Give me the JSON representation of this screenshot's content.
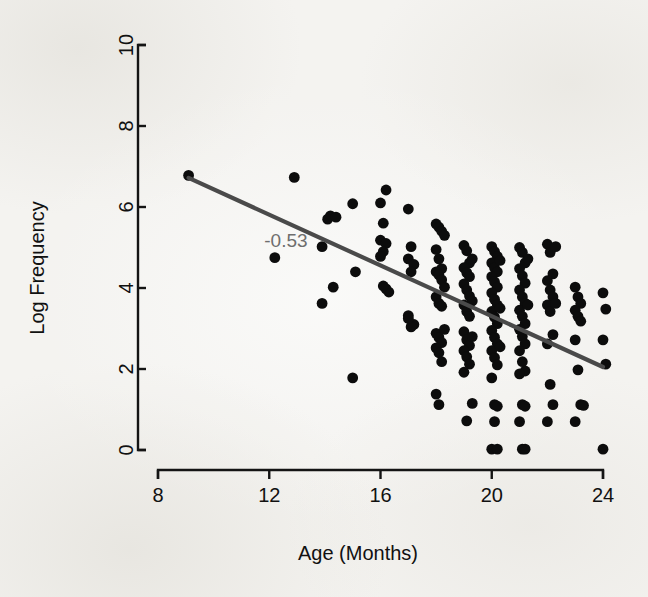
{
  "figure": {
    "background_color": "#f4f3f0",
    "point_color": "#0c0c0c",
    "line_color": "#4a4a4a",
    "annotation_color": "#6e6e6e",
    "axis_color": "#141414"
  },
  "chart_data": {
    "type": "scatter",
    "title": "",
    "subtitle": "",
    "xlabel": "Age (Months)",
    "ylabel": "Log Frequency",
    "xlim": [
      8,
      24
    ],
    "ylim": [
      0,
      10
    ],
    "xticks": [
      8,
      12,
      16,
      20,
      24
    ],
    "yticks": [
      0,
      2,
      4,
      6,
      8,
      10
    ],
    "xtick_labels": [
      "8",
      "12",
      "16",
      "20",
      "24"
    ],
    "ytick_labels": [
      "0",
      "2",
      "4",
      "6",
      "8",
      "10"
    ],
    "grid": false,
    "legend": null,
    "legend_position": "none",
    "annotations": [
      {
        "text": "-0.53",
        "x": 12.6,
        "y": 5.02,
        "color": "#6e6e6e",
        "meaning": "correlation-coefficient"
      }
    ],
    "series": [
      {
        "name": "observations",
        "marker": "filled-circle",
        "color": "#0c0c0c",
        "points": [
          [
            9.1,
            6.78
          ],
          [
            12.9,
            6.73
          ],
          [
            12.2,
            4.75
          ],
          [
            13.9,
            5.02
          ],
          [
            13.9,
            3.62
          ],
          [
            14.2,
            5.78
          ],
          [
            14.1,
            5.7
          ],
          [
            14.4,
            5.75
          ],
          [
            14.3,
            4.02
          ],
          [
            15.0,
            6.08
          ],
          [
            15.1,
            4.4
          ],
          [
            15.0,
            1.78
          ],
          [
            16.0,
            6.1
          ],
          [
            16.2,
            6.42
          ],
          [
            16.1,
            5.6
          ],
          [
            16.0,
            5.18
          ],
          [
            16.2,
            5.1
          ],
          [
            16.1,
            4.9
          ],
          [
            16.0,
            4.78
          ],
          [
            16.2,
            3.98
          ],
          [
            16.3,
            3.9
          ],
          [
            16.1,
            4.05
          ],
          [
            17.0,
            5.95
          ],
          [
            17.1,
            5.02
          ],
          [
            17.0,
            4.72
          ],
          [
            17.2,
            4.58
          ],
          [
            17.1,
            4.4
          ],
          [
            17.0,
            3.32
          ],
          [
            17.2,
            3.1
          ],
          [
            17.1,
            3.04
          ],
          [
            17.0,
            3.25
          ],
          [
            18.0,
            5.58
          ],
          [
            18.1,
            5.5
          ],
          [
            18.2,
            5.4
          ],
          [
            18.0,
            4.95
          ],
          [
            18.1,
            4.72
          ],
          [
            18.2,
            4.48
          ],
          [
            18.0,
            4.4
          ],
          [
            18.1,
            4.32
          ],
          [
            18.2,
            4.2
          ],
          [
            18.0,
            3.78
          ],
          [
            18.1,
            3.62
          ],
          [
            18.2,
            3.55
          ],
          [
            18.0,
            2.88
          ],
          [
            18.1,
            2.78
          ],
          [
            18.2,
            2.65
          ],
          [
            18.0,
            2.52
          ],
          [
            18.1,
            2.4
          ],
          [
            18.2,
            2.18
          ],
          [
            18.0,
            1.38
          ],
          [
            18.1,
            1.12
          ],
          [
            18.3,
            5.3
          ],
          [
            18.3,
            4.02
          ],
          [
            18.3,
            2.98
          ],
          [
            19.0,
            5.05
          ],
          [
            19.1,
            4.92
          ],
          [
            19.2,
            4.62
          ],
          [
            19.0,
            4.5
          ],
          [
            19.1,
            4.38
          ],
          [
            19.2,
            4.28
          ],
          [
            19.0,
            4.1
          ],
          [
            19.1,
            3.95
          ],
          [
            19.2,
            3.8
          ],
          [
            19.0,
            3.58
          ],
          [
            19.1,
            3.42
          ],
          [
            19.2,
            3.3
          ],
          [
            19.0,
            2.92
          ],
          [
            19.1,
            2.72
          ],
          [
            19.2,
            2.58
          ],
          [
            19.0,
            2.45
          ],
          [
            19.1,
            2.3
          ],
          [
            19.2,
            2.12
          ],
          [
            19.0,
            1.92
          ],
          [
            19.3,
            4.72
          ],
          [
            19.3,
            3.68
          ],
          [
            19.3,
            2.8
          ],
          [
            19.3,
            1.15
          ],
          [
            19.1,
            0.72
          ],
          [
            20.0,
            5.02
          ],
          [
            20.1,
            4.9
          ],
          [
            20.2,
            4.78
          ],
          [
            20.0,
            4.62
          ],
          [
            20.1,
            4.5
          ],
          [
            20.2,
            4.4
          ],
          [
            20.0,
            4.28
          ],
          [
            20.1,
            4.15
          ],
          [
            20.2,
            4.02
          ],
          [
            20.0,
            3.88
          ],
          [
            20.1,
            3.72
          ],
          [
            20.2,
            3.58
          ],
          [
            20.0,
            3.42
          ],
          [
            20.1,
            3.28
          ],
          [
            20.2,
            3.12
          ],
          [
            20.0,
            2.95
          ],
          [
            20.1,
            2.78
          ],
          [
            20.2,
            2.62
          ],
          [
            20.0,
            2.45
          ],
          [
            20.1,
            2.28
          ],
          [
            20.2,
            2.1
          ],
          [
            20.0,
            1.78
          ],
          [
            20.1,
            1.12
          ],
          [
            20.2,
            1.08
          ],
          [
            20.1,
            0.7
          ],
          [
            20.0,
            0.02
          ],
          [
            20.2,
            0.02
          ],
          [
            20.3,
            4.68
          ],
          [
            20.3,
            3.5
          ],
          [
            20.3,
            2.55
          ],
          [
            21.0,
            5.0
          ],
          [
            21.1,
            4.88
          ],
          [
            21.2,
            4.62
          ],
          [
            21.0,
            4.48
          ],
          [
            21.1,
            4.3
          ],
          [
            21.2,
            4.12
          ],
          [
            21.0,
            3.95
          ],
          [
            21.1,
            3.78
          ],
          [
            21.2,
            3.62
          ],
          [
            21.0,
            3.45
          ],
          [
            21.1,
            3.3
          ],
          [
            21.2,
            3.12
          ],
          [
            21.0,
            2.98
          ],
          [
            21.1,
            2.8
          ],
          [
            21.2,
            2.62
          ],
          [
            21.0,
            2.45
          ],
          [
            21.1,
            2.18
          ],
          [
            21.2,
            1.95
          ],
          [
            21.0,
            1.88
          ],
          [
            21.1,
            1.12
          ],
          [
            21.2,
            1.08
          ],
          [
            21.0,
            0.7
          ],
          [
            21.1,
            0.02
          ],
          [
            21.2,
            0.02
          ],
          [
            21.3,
            4.72
          ],
          [
            21.3,
            3.58
          ],
          [
            22.0,
            5.08
          ],
          [
            22.1,
            4.88
          ],
          [
            22.2,
            4.35
          ],
          [
            22.0,
            4.18
          ],
          [
            22.1,
            3.95
          ],
          [
            22.2,
            3.78
          ],
          [
            22.0,
            3.58
          ],
          [
            22.1,
            3.42
          ],
          [
            22.2,
            2.85
          ],
          [
            22.0,
            2.62
          ],
          [
            22.1,
            1.62
          ],
          [
            22.2,
            1.12
          ],
          [
            22.0,
            0.7
          ],
          [
            22.3,
            5.02
          ],
          [
            22.3,
            3.62
          ],
          [
            23.0,
            4.02
          ],
          [
            23.1,
            3.78
          ],
          [
            23.2,
            3.62
          ],
          [
            23.0,
            3.45
          ],
          [
            23.1,
            3.3
          ],
          [
            23.2,
            3.18
          ],
          [
            23.0,
            2.72
          ],
          [
            23.1,
            1.98
          ],
          [
            23.2,
            1.12
          ],
          [
            23.3,
            1.1
          ],
          [
            23.0,
            0.7
          ],
          [
            24.0,
            3.88
          ],
          [
            24.1,
            3.48
          ],
          [
            24.0,
            2.72
          ],
          [
            24.1,
            2.12
          ],
          [
            24.0,
            0.02
          ]
        ]
      }
    ],
    "fit_line": {
      "name": "linear-regression-fit",
      "color": "#4a4a4a",
      "x_start": 9.1,
      "y_start": 6.72,
      "x_end": 24.0,
      "y_end": 2.05,
      "slope": -0.3134,
      "correlation": -0.53
    }
  }
}
